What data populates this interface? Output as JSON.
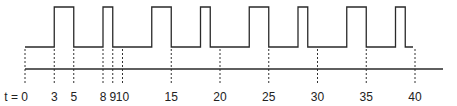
{
  "diagram": {
    "type": "timing-diagram",
    "colors": {
      "line": "#2a2a2a",
      "dash": "#333333",
      "text": "#222222",
      "background": "#ffffff"
    },
    "axis_labels": [
      {
        "t": 0,
        "label": "t = 0"
      },
      {
        "t": 3,
        "label": "3"
      },
      {
        "t": 5,
        "label": "5"
      },
      {
        "t": 8,
        "label": "8"
      },
      {
        "t": 9,
        "label": "9"
      },
      {
        "t": 10,
        "label": "10"
      },
      {
        "t": 15,
        "label": "15"
      },
      {
        "t": 20,
        "label": "20"
      },
      {
        "t": 25,
        "label": "25"
      },
      {
        "t": 30,
        "label": "30"
      },
      {
        "t": 35,
        "label": "35"
      },
      {
        "t": 40,
        "label": "40"
      }
    ],
    "pulses": [
      {
        "rise": 3,
        "fall": 5
      },
      {
        "rise": 8,
        "fall": 9
      },
      {
        "rise": 13,
        "fall": 15
      },
      {
        "rise": 18,
        "fall": 19
      },
      {
        "rise": 23,
        "fall": 25
      },
      {
        "rise": 28,
        "fall": 29
      },
      {
        "rise": 33,
        "fall": 35
      },
      {
        "rise": 38,
        "fall": 39
      }
    ],
    "waveform_start": 0,
    "waveform_end": 40
  }
}
